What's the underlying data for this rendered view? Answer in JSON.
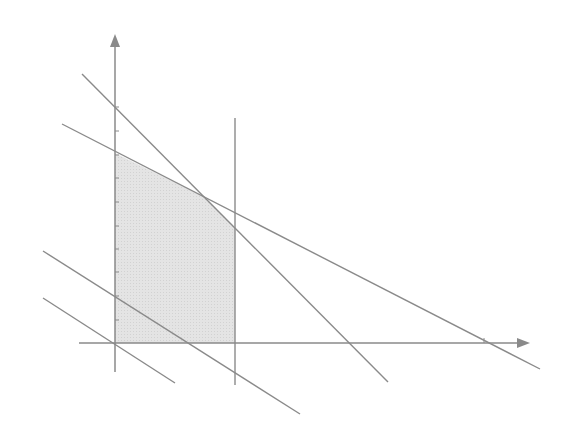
{
  "diagram": {
    "colors": {
      "background": "#ffffff",
      "line": "#8a8a8a",
      "axis": "#8a8a8a",
      "region_fill": "#e2e2e2"
    },
    "origin": [
      115,
      343
    ],
    "axes": {
      "x": {
        "from": [
          79,
          343
        ],
        "to": [
          530,
          343
        ],
        "arrow": true,
        "ticks": [
          [
            484,
            343
          ]
        ]
      },
      "y": {
        "from": [
          115,
          372
        ],
        "to": [
          115,
          34
        ],
        "arrow": true,
        "ticks": [
          [
            115,
            107
          ],
          [
            115,
            131
          ],
          [
            115,
            155
          ],
          [
            115,
            178
          ],
          [
            115,
            202
          ],
          [
            115,
            226
          ],
          [
            115,
            249
          ],
          [
            115,
            272
          ],
          [
            115,
            296
          ],
          [
            115,
            320
          ]
        ]
      }
    },
    "lines": [
      {
        "name": "steep-constraint-line",
        "from": [
          82,
          74
        ],
        "to": [
          388,
          382
        ]
      },
      {
        "name": "shallow-constraint-line",
        "from": [
          62,
          124
        ],
        "to": [
          540,
          369
        ]
      },
      {
        "name": "vertical-constraint-line",
        "from": [
          235,
          118
        ],
        "to": [
          235,
          385
        ]
      },
      {
        "name": "lower-objective-line-1",
        "from": [
          43,
          251
        ],
        "to": [
          300,
          414
        ]
      },
      {
        "name": "lower-objective-line-2",
        "from": [
          43,
          298
        ],
        "to": [
          175,
          383
        ]
      }
    ],
    "feasible_region": {
      "vertices": [
        [
          115,
          153
        ],
        [
          204,
          197
        ],
        [
          235,
          228
        ],
        [
          235,
          343
        ],
        [
          115,
          343
        ]
      ]
    }
  }
}
